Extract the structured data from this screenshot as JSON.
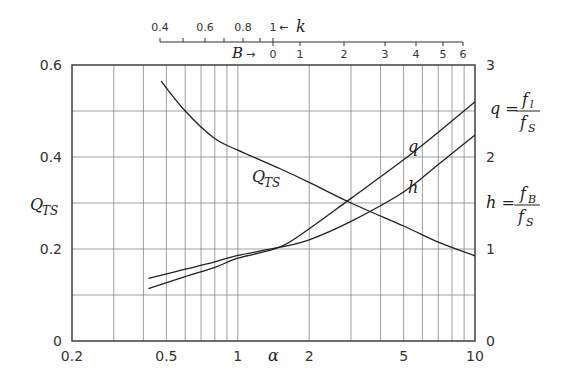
{
  "chart_data": {
    "type": "line",
    "title": "",
    "xlabel": "α",
    "xscale": "log",
    "xlim": [
      0.2,
      10
    ],
    "x_ticks": [
      {
        "value": 0.2,
        "label": "0.2"
      },
      {
        "value": 0.5,
        "label": "0.5"
      },
      {
        "value": 1,
        "label": "1"
      },
      {
        "value": 2,
        "label": "2"
      },
      {
        "value": 5,
        "label": "5"
      },
      {
        "value": 10,
        "label": "10"
      }
    ],
    "x_minor_gridlines": [
      0.3,
      0.4,
      0.5,
      0.6,
      0.7,
      0.8,
      0.9,
      1,
      2,
      3,
      4,
      5,
      6,
      7,
      8,
      9
    ],
    "ylabel_left": "Q_TS",
    "ylim_left": [
      0,
      0.6
    ],
    "y_ticks_left": [
      "0",
      "0.2",
      "0.4",
      "0.6"
    ],
    "ylabel_right_q": "q = f_l / f_S",
    "ylabel_right_h": "h = f_B / f_S",
    "ylim_right": [
      0,
      3
    ],
    "y_ticks_right": [
      "0",
      "1",
      "2",
      "3"
    ],
    "grid": true,
    "top_axis": {
      "k_label": "k",
      "k_ticks": [
        "0.4",
        "0.6",
        "0.8",
        "1"
      ],
      "k_values": [
        0.4,
        0.5,
        0.6,
        0.7,
        0.8,
        0.9,
        1.0
      ],
      "b_label": "B",
      "b_ticks": [
        "0",
        "1",
        "2",
        "3",
        "4",
        "5",
        "6"
      ]
    },
    "series": [
      {
        "name": "Q_TS",
        "axis": "left",
        "x": [
          0.475,
          0.6,
          0.8,
          1,
          1.5,
          2,
          3,
          5,
          7,
          10
        ],
        "values": [
          0.565,
          0.5,
          0.44,
          0.415,
          0.375,
          0.345,
          0.3,
          0.25,
          0.215,
          0.185
        ]
      },
      {
        "name": "q",
        "axis": "right",
        "x": [
          0.42,
          0.6,
          0.8,
          1,
          1.5,
          2,
          3,
          5,
          7,
          10
        ],
        "values": [
          0.57,
          0.7,
          0.8,
          0.9,
          1.02,
          1.22,
          1.55,
          1.97,
          2.27,
          2.6
        ]
      },
      {
        "name": "h",
        "axis": "right",
        "x": [
          0.42,
          0.6,
          0.8,
          1,
          1.5,
          2,
          3,
          5,
          7,
          10
        ],
        "values": [
          0.68,
          0.78,
          0.86,
          0.93,
          1.02,
          1.1,
          1.3,
          1.62,
          1.92,
          2.24
        ]
      }
    ],
    "annotations": [
      "Q_TS",
      "q",
      "h",
      "B →",
      "← k"
    ]
  },
  "labels": {
    "x_axis": "α",
    "left_axis": "Q",
    "left_axis_sub": "TS",
    "right_q": "q =",
    "right_q_num": "f",
    "right_q_num_sub": "l",
    "right_q_den": "f",
    "right_q_den_sub": "S",
    "right_h": "h =",
    "right_h_num": "f",
    "right_h_num_sub": "B",
    "right_h_den": "f",
    "right_h_den_sub": "S",
    "curve_qts": "Q",
    "curve_qts_sub": "TS",
    "curve_q": "q",
    "curve_h": "h",
    "top_k": "k",
    "top_k_arrow": "←",
    "top_b": "B",
    "top_b_arrow": "→"
  }
}
